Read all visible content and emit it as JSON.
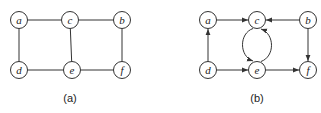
{
  "diagrams": [
    {
      "id": "a",
      "caption": "(a)",
      "directed": false,
      "nodes": [
        "a",
        "c",
        "b",
        "d",
        "e",
        "f"
      ],
      "edges": [
        {
          "from": "a",
          "to": "c"
        },
        {
          "from": "c",
          "to": "b"
        },
        {
          "from": "a",
          "to": "d"
        },
        {
          "from": "c",
          "to": "e"
        },
        {
          "from": "b",
          "to": "f"
        },
        {
          "from": "d",
          "to": "e"
        },
        {
          "from": "e",
          "to": "f"
        }
      ]
    },
    {
      "id": "b",
      "caption": "(b)",
      "directed": true,
      "nodes": [
        "a",
        "c",
        "b",
        "d",
        "e",
        "f"
      ],
      "edges": [
        {
          "from": "a",
          "to": "c"
        },
        {
          "from": "b",
          "to": "c"
        },
        {
          "from": "d",
          "to": "a"
        },
        {
          "from": "d",
          "to": "e"
        },
        {
          "from": "e",
          "to": "f"
        },
        {
          "from": "b",
          "to": "f"
        },
        {
          "from": "c",
          "to": "e",
          "curve": "left"
        },
        {
          "from": "e",
          "to": "c",
          "curve": "right"
        }
      ]
    }
  ]
}
